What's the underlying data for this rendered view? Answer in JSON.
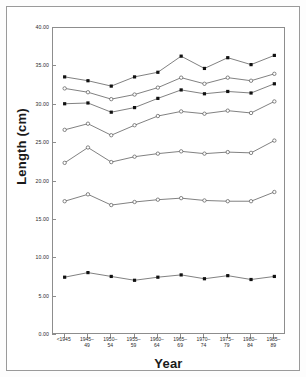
{
  "chart_data": {
    "type": "line",
    "title": "",
    "xlabel": "Year",
    "ylabel": "Length (cm)",
    "ylim": [
      0.0,
      40.0
    ],
    "yticks": [
      "0.00",
      "5.00",
      "10.00",
      "15.00",
      "20.00",
      "25.00",
      "30.00",
      "35.00",
      "40.00"
    ],
    "ytick_values": [
      0,
      5,
      10,
      15,
      20,
      25,
      30,
      35,
      40
    ],
    "grid": false,
    "legend": "none",
    "categories": [
      "<1945",
      "1945–49",
      "1950–54",
      "1955–59",
      "1960–64",
      "1965–69",
      "1970–74",
      "1975–79",
      "1980–84",
      "1985–89"
    ],
    "categories_line1": [
      "<1945",
      "1945–",
      "1950–",
      "1955–",
      "1960–",
      "1965–",
      "1970–",
      "1975–",
      "1980–",
      "1985–"
    ],
    "categories_line2": [
      "",
      "49",
      "54",
      "59",
      "64",
      "69",
      "74",
      "79",
      "84",
      "89"
    ],
    "series": [
      {
        "name": "series-1",
        "marker": "filled-square",
        "values": [
          33.5,
          33.0,
          32.3,
          33.5,
          34.1,
          36.2,
          34.6,
          36.0,
          35.1,
          36.3
        ]
      },
      {
        "name": "series-2",
        "marker": "open-circle",
        "values": [
          32.0,
          31.5,
          30.6,
          31.2,
          32.1,
          33.4,
          32.6,
          33.4,
          33.0,
          33.9
        ]
      },
      {
        "name": "series-3",
        "marker": "filled-square",
        "values": [
          30.0,
          30.1,
          28.9,
          29.5,
          30.7,
          31.8,
          31.3,
          31.6,
          31.4,
          32.6
        ]
      },
      {
        "name": "series-4",
        "marker": "open-circle",
        "values": [
          26.6,
          27.4,
          25.9,
          27.2,
          28.4,
          29.0,
          28.7,
          29.1,
          28.8,
          30.3
        ]
      },
      {
        "name": "series-5",
        "marker": "open-circle",
        "values": [
          22.3,
          24.3,
          22.4,
          23.1,
          23.5,
          23.8,
          23.5,
          23.7,
          23.6,
          25.2
        ]
      },
      {
        "name": "series-6",
        "marker": "open-circle",
        "values": [
          17.3,
          18.2,
          16.8,
          17.2,
          17.5,
          17.7,
          17.4,
          17.3,
          17.3,
          18.5
        ]
      },
      {
        "name": "series-7",
        "marker": "filled-square",
        "values": [
          7.4,
          8.0,
          7.5,
          7.0,
          7.4,
          7.7,
          7.2,
          7.6,
          7.1,
          7.5
        ]
      }
    ]
  },
  "axes": {
    "y_title": "Length (cm)",
    "x_title": "Year"
  }
}
